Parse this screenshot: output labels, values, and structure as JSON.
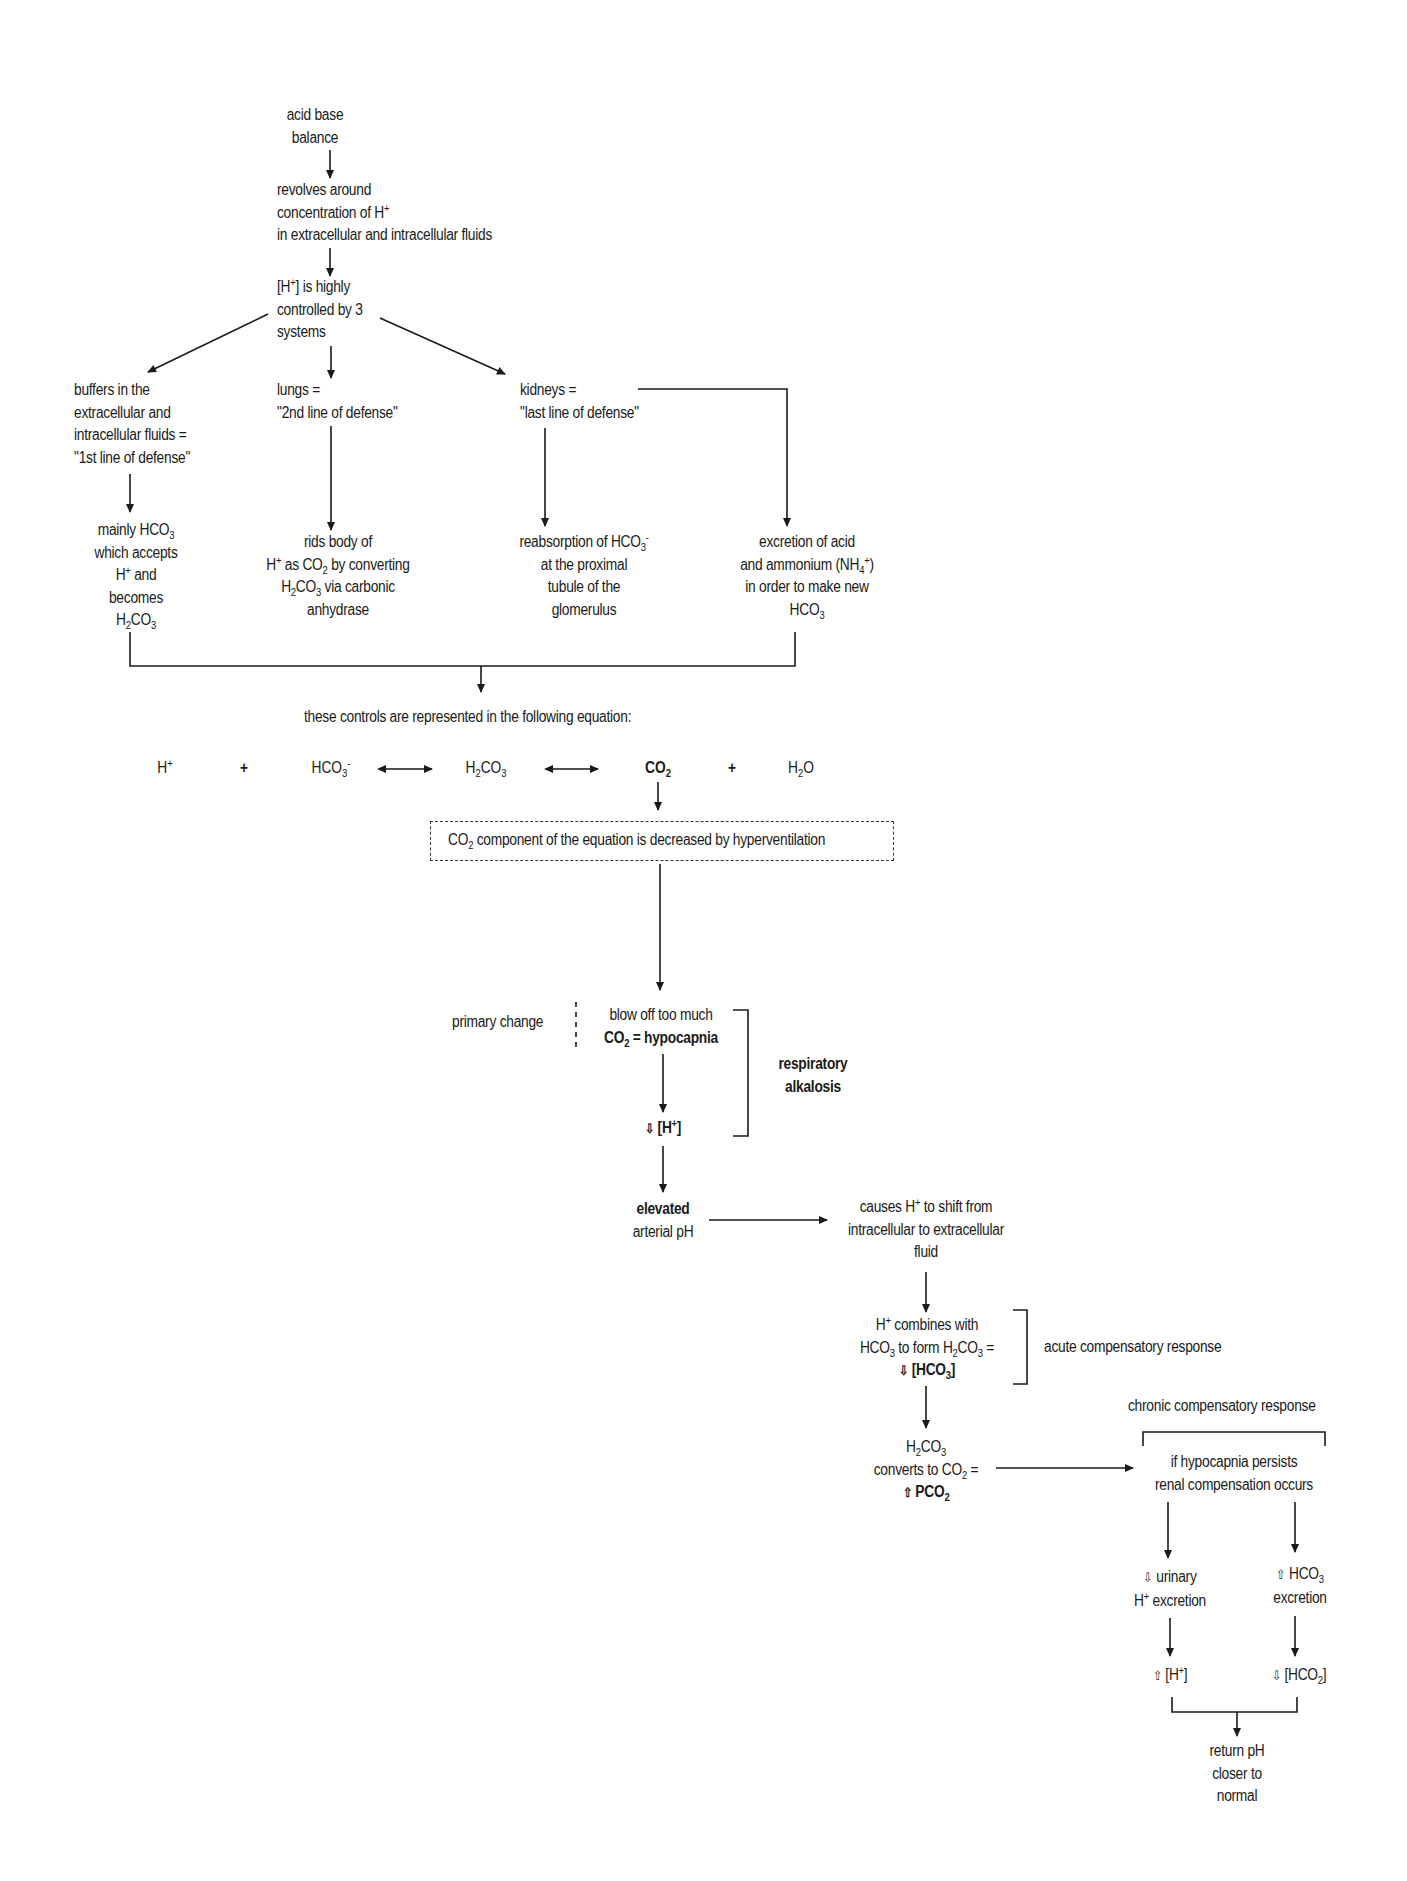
{
  "diagram": {
    "title": "acid base balance",
    "nodes": {
      "root": {
        "lines": [
          "acid base",
          "balance"
        ]
      },
      "revolves": {
        "lines": [
          "revolves around",
          "concentration of H+",
          "in extracellular and intracellular fluids"
        ]
      },
      "controlled": {
        "lines": [
          "[H+] is highly",
          "controlled by 3",
          "systems"
        ]
      },
      "buffers": {
        "lines": [
          "buffers in the",
          "extracellular and",
          "intracellular fluids =",
          "\"1st line of defense\""
        ]
      },
      "lungs": {
        "lines": [
          "lungs =",
          "\"2nd line of defense\""
        ]
      },
      "kidneys": {
        "lines": [
          "kidneys =",
          "\"last line of defense\""
        ]
      },
      "mainly_hco3": {
        "lines": [
          "mainly HCO3",
          "which accepts",
          "H+ and",
          "becomes",
          "H2CO3"
        ]
      },
      "rids_body": {
        "lines": [
          "rids body of",
          "H+ as CO2 by converting",
          "H2CO3 via carbonic",
          "anhydrase"
        ]
      },
      "reabsorption": {
        "lines": [
          "reabsorption of HCO3-",
          "at the proximal",
          "tubule of the",
          "glomerulus"
        ]
      },
      "excretion_acid": {
        "lines": [
          "excretion of acid",
          "and ammonium (NH4+)",
          "in order to make new",
          "HCO3"
        ]
      },
      "controls_equation": {
        "text": "these controls are represented in the following equation:"
      },
      "co2_decreased": {
        "text": "CO2 component of the equation is decreased by hyperventilation"
      },
      "primary_change": {
        "text": "primary change"
      },
      "blow_off": {
        "lines": [
          "blow off too much",
          "CO2 = hypocapnia"
        ]
      },
      "respiratory_alkalosis": {
        "lines": [
          "respiratory",
          "alkalosis"
        ]
      },
      "decreased_h": {
        "text": "[H+]",
        "indicator": "down"
      },
      "elevated_ph": {
        "lines": [
          "elevated",
          "arterial pH"
        ]
      },
      "causes_shift": {
        "lines": [
          "causes H+ to shift from",
          "intracellular to extracellular",
          "fluid"
        ]
      },
      "combines": {
        "lines": [
          "H+ combines with",
          "HCO3 to form H2CO3 =",
          "[HCO3]"
        ],
        "indicator": "down"
      },
      "acute_response": {
        "text": "acute compensatory response"
      },
      "chronic_response": {
        "text": "chronic compensatory response"
      },
      "converts": {
        "lines": [
          "H2CO3",
          "converts to CO2 =",
          "PCO2"
        ],
        "indicator": "up"
      },
      "renal": {
        "lines": [
          "if hypocapnia persists",
          "renal compensation occurs"
        ]
      },
      "urinary": {
        "lines": [
          "urinary",
          "H+ excretion"
        ],
        "indicator": "down"
      },
      "hco3_excretion": {
        "lines": [
          "HCO3",
          "excretion"
        ],
        "indicator": "up"
      },
      "increased_h": {
        "text": "[H+]",
        "indicator": "up"
      },
      "decreased_hco2": {
        "text": "[HCO2]",
        "indicator": "down"
      },
      "return_ph": {
        "lines": [
          "return pH",
          "closer to",
          "normal"
        ]
      }
    },
    "equation": {
      "terms": [
        "H+",
        "+",
        "HCO3-",
        "<->",
        "H2CO3",
        "<->",
        "CO2",
        "+",
        "H2O"
      ],
      "highlighted_term": "CO2"
    },
    "indicators": {
      "up": "⇧",
      "down": "⇩"
    },
    "colors": {
      "ink": "#1a1a1a",
      "background": "#ffffff"
    }
  }
}
